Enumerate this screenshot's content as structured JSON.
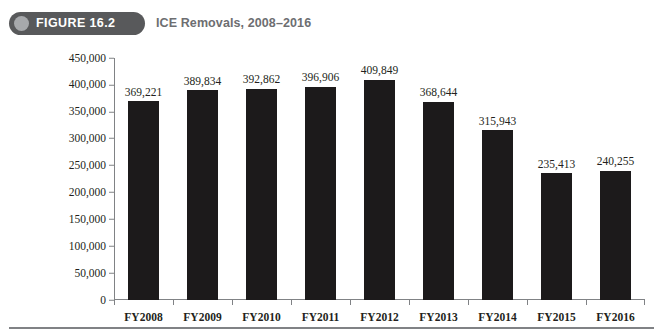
{
  "header": {
    "badge_label": "FIGURE 16.2",
    "badge_icon": "circle-icon",
    "title": "ICE Removals, 2008–2016",
    "badge_color": "#58595B",
    "badge_dot_color": "#A7A9AC",
    "title_color": "#6D6E71"
  },
  "chart_data": {
    "type": "bar",
    "title": "ICE Removals, 2008–2016",
    "xlabel": "",
    "ylabel": "",
    "categories": [
      "FY2008",
      "FY2009",
      "FY2010",
      "FY2011",
      "FY2012",
      "FY2013",
      "FY2014",
      "FY2015",
      "FY2016"
    ],
    "values": [
      369221,
      389834,
      392862,
      396906,
      409849,
      368644,
      315943,
      235413,
      240255
    ],
    "value_labels": [
      "369,221",
      "389,834",
      "392,862",
      "396,906",
      "409,849",
      "368,644",
      "315,943",
      "235,413",
      "240,255"
    ],
    "ylim": [
      0,
      450000
    ],
    "ytick_values": [
      0,
      50000,
      100000,
      150000,
      200000,
      250000,
      300000,
      350000,
      400000,
      450000
    ],
    "ytick_labels": [
      "0",
      "50,000",
      "100,000",
      "150,000",
      "200,000",
      "250,000",
      "300,000",
      "350,000",
      "400,000",
      "450,000"
    ],
    "grid": false,
    "legend": false,
    "bar_color": "#1C1A1B",
    "axis_color": "#808285"
  }
}
